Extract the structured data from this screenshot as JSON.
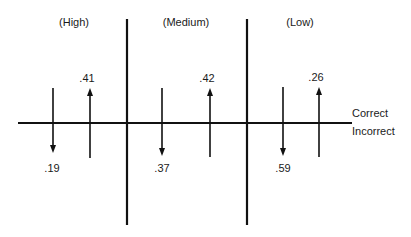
{
  "diagram": {
    "categories": [
      {
        "label": "(High)",
        "center_x": 74
      },
      {
        "label": "(Medium)",
        "center_x": 186
      },
      {
        "label": "(Low)",
        "center_x": 300
      }
    ],
    "axis_labels": {
      "above": "Correct",
      "below": "Incorrect"
    },
    "arrows": [
      {
        "group": "High",
        "direction": "down",
        "value": ".19",
        "x": 53
      },
      {
        "group": "High",
        "direction": "up",
        "value": ".41",
        "x": 90
      },
      {
        "group": "Medium",
        "direction": "down",
        "value": ".37",
        "x": 162
      },
      {
        "group": "Medium",
        "direction": "up",
        "value": ".42",
        "x": 210
      },
      {
        "group": "Low",
        "direction": "down",
        "value": ".59",
        "x": 283
      },
      {
        "group": "Low",
        "direction": "up",
        "value": ".26",
        "x": 319
      }
    ],
    "colors": {
      "line": "#111111",
      "background": "#ffffff"
    }
  }
}
